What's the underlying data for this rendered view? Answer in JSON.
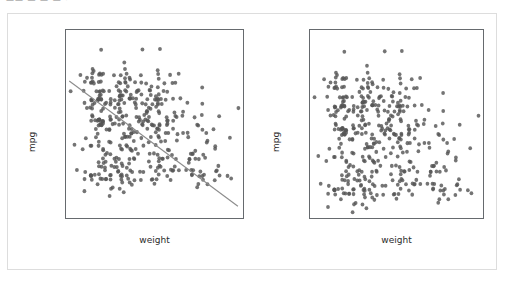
{
  "top_fragment": "—— — — — ·",
  "figure": {
    "background": "#ffffff",
    "border_color": "#dddddd",
    "point_color": "#555555",
    "line_color": "#8c8c8c"
  },
  "panels": [
    {
      "name": "scatter-with-regression",
      "xlabel": "weight",
      "ylabel": "mpg",
      "xticks": [
        "1500",
        "2000",
        "2500",
        "3000",
        "3500",
        "4000",
        "4500",
        "5000"
      ],
      "yticks": [
        "5",
        "10",
        "15",
        "20",
        "25",
        "30",
        "35",
        "40",
        "45"
      ]
    },
    {
      "name": "scatter-plain",
      "xlabel": "weight",
      "ylabel": "mpg",
      "xticks": [
        "1500",
        "2000",
        "2500",
        "3000",
        "3500",
        "4000",
        "4500",
        "5000"
      ],
      "yticks": [
        "10",
        "15",
        "20",
        "25",
        "30",
        "35",
        "40",
        "45"
      ]
    }
  ],
  "chart_data": [
    {
      "type": "scatter",
      "title": "",
      "xlabel": "weight",
      "ylabel": "mpg",
      "xlim": [
        1430,
        5250
      ],
      "ylim": [
        3.8,
        48.5
      ],
      "xticks": [
        1500,
        2000,
        2500,
        3000,
        3500,
        4000,
        4500,
        5000
      ],
      "yticks": [
        5,
        10,
        15,
        20,
        25,
        30,
        35,
        40,
        45
      ],
      "grid": false,
      "legend": null,
      "marker_color": "#555555",
      "marker_size": 4,
      "regression_line": {
        "color": "#8c8c8c",
        "x": [
          1500,
          5140
        ],
        "y": [
          36.4,
          6.6
        ],
        "slope": -0.00819,
        "intercept": 48.68
      },
      "x": [
        3504,
        3693,
        3436,
        3433,
        3449,
        4341,
        4354,
        4312,
        4425,
        3850,
        3090,
        4142,
        4034,
        4166,
        3850,
        3563,
        3609,
        3353,
        3761,
        3086,
        2372,
        2833,
        2774,
        2587,
        2130,
        1835,
        2672,
        2430,
        2375,
        2234,
        2648,
        4615,
        4376,
        4382,
        4732,
        2130,
        2264,
        2228,
        2046,
        1978,
        2634,
        3439,
        3329,
        3302,
        3288,
        4209,
        4464,
        4154,
        4096,
        4955,
        4746,
        5140,
        2962,
        2408,
        3282,
        3139,
        2220,
        2123,
        2074,
        2065,
        1773,
        1613,
        1834,
        1955,
        2278,
        2126,
        2254,
        2408,
        2226,
        4274,
        4385,
        4135,
        4129,
        3672,
        4633,
        4732,
        4440,
        4498,
        4657,
        4257,
        3821,
        3121,
        3278,
        2945,
        3021,
        2904,
        1950,
        4997,
        4906,
        4654,
        4499,
        2789,
        2279,
        2401,
        2379,
        2124,
        2310,
        2472,
        2265,
        4082,
        4278,
        1867,
        2158,
        2582,
        2868,
        3399,
        2660,
        2807,
        3664,
        3102,
        2875,
        2901,
        3336,
        1950,
        2451,
        1836,
        2542,
        3781,
        3632,
        3613,
        4141,
        4699,
        4457,
        4638,
        4257,
        2219,
        1963,
        2300,
        1649,
        2003,
        2125,
        2108,
        2350,
        2637,
        2215,
        2909,
        2490,
        2635,
        2620,
        2725,
        2385,
        3169,
        3277,
        3312,
        3169,
        3429,
        4360,
        4054,
        3605,
        3940,
        4274,
        4385,
        3220,
        3821,
        4165,
        3735,
        3415,
        3560,
        3465,
        2605,
        2640,
        2395,
        2575,
        2525,
        2735,
        2865,
        1980,
        2190,
        2815,
        2600,
        2700,
        3365,
        3735,
        3570,
        3535,
        3155,
        2965,
        2720,
        3430,
        3210,
        3380,
        3070,
        3620,
        3410,
        3425,
        3445,
        3205,
        4080,
        2155,
        2560,
        2300,
        2230,
        2800,
        3230,
        3380,
        3785,
        3630,
        3410,
        2800,
        2785,
        3250,
        3039,
        4215,
        2930,
        3725,
        3060,
        3465,
        2605,
        2640,
        2395,
        2575,
        2525,
        2735,
        2865,
        1980,
        2190,
        2815,
        2600,
        2720,
        3430,
        3210,
        3380,
        3070,
        3620,
        3410,
        2925,
        3060,
        3465,
        2605,
        2640,
        2395,
        2575,
        1795,
        2125,
        2585,
        2835,
        2665,
        1530,
        3892,
        3102,
        4209,
        3725,
        3955,
        3830,
        2585,
        2910,
        1975,
        2125,
        2180,
        2155,
        2045,
        1985,
        2015,
        2190,
        2150,
        3670,
        2815,
        3410,
        3180,
        2200,
        2490,
        2156,
        1970,
        2120,
        1965,
        2075,
        2190,
        2585,
        2740,
        2255,
        2565,
        1900,
        2760,
        2710,
        2380,
        2085,
        2200,
        2035,
        2490,
        2215,
        2010,
        1985,
        2135,
        2670,
        2950,
        3250,
        3000,
        2150,
        2155,
        1825,
        1990,
        2155,
        3850,
        3480,
        3785,
        3570,
        2735,
        2215,
        2710,
        2790,
        2255,
        2965,
        3430,
        3415,
        3725,
        3060,
        3465,
        2605,
        2640,
        2395,
        2575,
        2525,
        2735,
        2865,
        1980,
        2190,
        2815,
        2600,
        2700,
        3365,
        3735,
        3570,
        3535,
        3155,
        2965,
        2720,
        3430,
        3210,
        3380,
        3070,
        3620,
        3410,
        3425,
        3445,
        3205,
        4080,
        2155,
        2560,
        2300,
        2230,
        2800,
        3230,
        3380,
        3785,
        3630,
        3410,
        2800,
        2785,
        3250,
        3039,
        2470,
        2620,
        2725,
        2385,
        3169,
        3277,
        3312,
        3169,
        3429,
        4360,
        4054,
        3605,
        3940,
        1755,
        1875,
        2700,
        2490,
        2220,
        2125,
        2160,
        2205,
        2245,
        1965,
        1965,
        1995,
        2945,
        3015,
        2585,
        2835,
        2665,
        2370,
        2950,
        3250,
        3000,
        2150,
        2155,
        1825,
        1990,
        2155,
        2620,
        2725,
        2385,
        2045,
        2380,
        2190,
        2320,
        2885,
        3060,
        3465,
        2605,
        2640,
        2395,
        2575,
        2525,
        2735,
        2865,
        1980,
        2190,
        2815
      ],
      "y": [
        18,
        15,
        18,
        16,
        17,
        15,
        14,
        14,
        14,
        15,
        15,
        14,
        15,
        14,
        24,
        22,
        18,
        21,
        27,
        26,
        25,
        24,
        25,
        26,
        21,
        10,
        10,
        11,
        9,
        27,
        28,
        25,
        25,
        19,
        16,
        17,
        19,
        18,
        14,
        14,
        14,
        14,
        12,
        13,
        13,
        18,
        22,
        19,
        18,
        23,
        28,
        30,
        30,
        31,
        35,
        27,
        26,
        24,
        25,
        23,
        20,
        21,
        13,
        14,
        15,
        14,
        17,
        11,
        13,
        12,
        13,
        19,
        15,
        13,
        13,
        14,
        18,
        22,
        21,
        26,
        22,
        28,
        23,
        28,
        27,
        13,
        14,
        13,
        14,
        15,
        12,
        13,
        13,
        14,
        13,
        12,
        13,
        18,
        16,
        18,
        18,
        23,
        26,
        11,
        12,
        13,
        12,
        18,
        20,
        21,
        22,
        18,
        19,
        21,
        26,
        15,
        16,
        29,
        24,
        20,
        19,
        15,
        24,
        20,
        11,
        20,
        21,
        19,
        15,
        31,
        26,
        32,
        25,
        16,
        16,
        18,
        16,
        13,
        14,
        14,
        14,
        29,
        26,
        26,
        31,
        32,
        28,
        24,
        26,
        24,
        26,
        31,
        19,
        18,
        15,
        15,
        16,
        15,
        16,
        14,
        17,
        16,
        15,
        18,
        21,
        20,
        13,
        29,
        23,
        20,
        23,
        24,
        25,
        24,
        18,
        29,
        19,
        23,
        23,
        22,
        25,
        33,
        28,
        25,
        25,
        26,
        27,
        17,
        16,
        15,
        17,
        20,
        20,
        17,
        15,
        16,
        14,
        19,
        15,
        17,
        16,
        15,
        20,
        20,
        15,
        13,
        26,
        33,
        23,
        22,
        33,
        28,
        23,
        25,
        30,
        26,
        20,
        29,
        21,
        23,
        28,
        30,
        26,
        26,
        31,
        36,
        31,
        32,
        34,
        33,
        31,
        34,
        34,
        27,
        27,
        24,
        28,
        34,
        32,
        27,
        28,
        19,
        28,
        28,
        30,
        31,
        37,
        32,
        32,
        38,
        39,
        36,
        36,
        36,
        34,
        38,
        32,
        38,
        25,
        38,
        26,
        22,
        32,
        36,
        27,
        27,
        44,
        32,
        28,
        31,
        31,
        37,
        35,
        37,
        34,
        34,
        33,
        36,
        30,
        27,
        28,
        28,
        32,
        26,
        31,
        33,
        28,
        27,
        27,
        31,
        36,
        27,
        38,
        31,
        36,
        36,
        36,
        34,
        39,
        37,
        34,
        34,
        32,
        35,
        36,
        38,
        44,
        36,
        32,
        28,
        29,
        35,
        34,
        32,
        32,
        32,
        33,
        38,
        41,
        32,
        32,
        32,
        34,
        36,
        34,
        36,
        29,
        30,
        33,
        44,
        34,
        39,
        37,
        29,
        27,
        23,
        33,
        36,
        31,
        27,
        26,
        34,
        32,
        28,
        27,
        31,
        37,
        32,
        34,
        36,
        38,
        33,
        38,
        27,
        32,
        31,
        26,
        29,
        33,
        35,
        31,
        27,
        29,
        38,
        30,
        31,
        32,
        38,
        27,
        27,
        26,
        30,
        30,
        32,
        38,
        32,
        27,
        31,
        32,
        24,
        22,
        24,
        30,
        34,
        34,
        32,
        36,
        39,
        38,
        33,
        34,
        32,
        31,
        27,
        26,
        25,
        24,
        23,
        22,
        21,
        20,
        19,
        18,
        17,
        16,
        15,
        14,
        13,
        12,
        11,
        10,
        9
      ]
    },
    {
      "type": "scatter",
      "title": "",
      "xlabel": "weight",
      "ylabel": "mpg",
      "xlim": [
        1430,
        5250
      ],
      "ylim": [
        7.8,
        48.5
      ],
      "xticks": [
        1500,
        2000,
        2500,
        3000,
        3500,
        4000,
        4500,
        5000
      ],
      "yticks": [
        10,
        15,
        20,
        25,
        30,
        35,
        40,
        45
      ],
      "grid": false,
      "legend": null,
      "marker_color": "#555555",
      "marker_size": 4,
      "regression_line": null
    }
  ]
}
